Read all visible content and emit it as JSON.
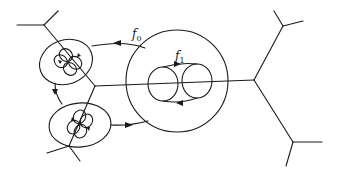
{
  "diagram": {
    "type": "topological-map-diagram",
    "colors": {
      "stroke": "#1a1a1a",
      "background": "#ffffff"
    },
    "labels": {
      "f0": {
        "base": "f",
        "subscript": "0"
      },
      "f1": {
        "base": "f",
        "subscript": "1"
      }
    },
    "components": {
      "large_circle": "region carrying map f1 with two inner ellipses",
      "upper_left_ellipse": "small region with four-lobed cycle",
      "lower_left_ellipse": "small region with four-lobed cycle",
      "trees": "branching edges (trivalent vertices) extending off the graph"
    }
  }
}
